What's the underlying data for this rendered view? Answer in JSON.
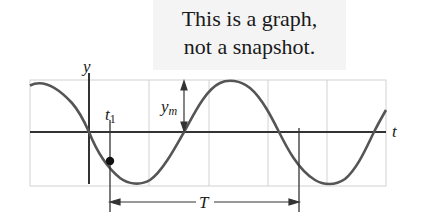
{
  "caption": {
    "line1": "This is a graph,",
    "line2": "not a snapshot."
  },
  "axes": {
    "y_label": "y",
    "x_label": "t"
  },
  "annotations": {
    "t1_label": "t",
    "t1_subscript": "1",
    "amplitude_label": "y",
    "amplitude_subscript": "m",
    "period_label": "T"
  },
  "colors": {
    "curve": "#555555",
    "axis": "#333333",
    "grid": "#cfcfcf",
    "caption_bg": "#f4f4f4"
  }
}
